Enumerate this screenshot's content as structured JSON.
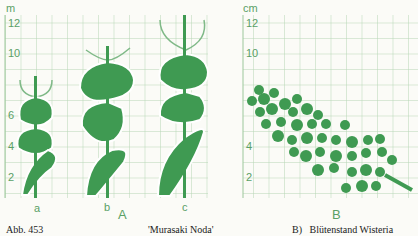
{
  "panelA": {
    "unit": "m",
    "ticks": [
      "12",
      "10",
      "6",
      "4",
      "2"
    ],
    "plants": [
      "a",
      "b",
      "c"
    ],
    "label": "A"
  },
  "panelB": {
    "unit": "cm",
    "ticks": [
      "12",
      "10",
      "4",
      "2"
    ],
    "label": "B"
  },
  "caption": {
    "figure": "Abb. 453",
    "cultivar": "'Murasaki Noda'",
    "description": "B)   Blütenstand Wisteria"
  },
  "colors": {
    "green": "#3f9a52",
    "grid": "#a9cfa9"
  }
}
